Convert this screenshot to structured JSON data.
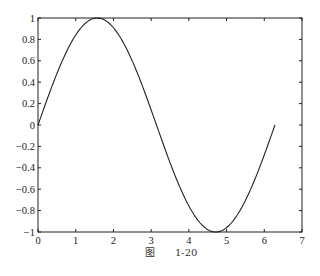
{
  "chart_data": {
    "type": "line",
    "title": "",
    "xlabel": "",
    "ylabel": "",
    "xlim": [
      0,
      7
    ],
    "ylim": [
      -1,
      1
    ],
    "grid": false,
    "legend": null,
    "x_ticks": [
      "0",
      "1",
      "2",
      "3",
      "4",
      "5",
      "6",
      "7"
    ],
    "y_ticks": [
      "1",
      "0.8",
      "0.6",
      "0.4",
      "0.2",
      "0",
      "-0.2",
      "-0.4",
      "-0.6",
      "-0.8",
      "-1"
    ],
    "series": [
      {
        "name": "sin(x)",
        "function": "y = sin(x), x in [0, 2*pi]",
        "x": [
          0,
          0.5,
          1.0,
          1.5708,
          2.0,
          2.5,
          3.0,
          3.1416,
          3.5,
          4.0,
          4.7124,
          5.0,
          5.5,
          6.0,
          6.2832
        ],
        "y": [
          0,
          0.479,
          0.841,
          1.0,
          0.909,
          0.598,
          0.141,
          0,
          -0.351,
          -0.757,
          -1.0,
          -0.959,
          -0.706,
          -0.279,
          0
        ],
        "color": "#222222"
      }
    ],
    "caption": "图   1-20"
  },
  "caption": {
    "figure_label": "图",
    "figure_number": "1-20"
  }
}
